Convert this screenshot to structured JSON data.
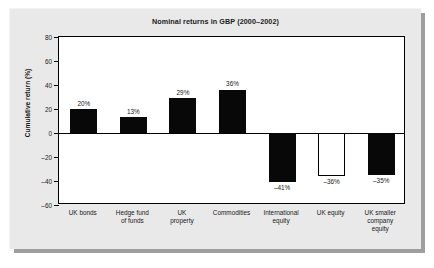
{
  "chart_data": {
    "type": "bar",
    "title": "Nominal returns in GBP (2000–2002)",
    "xlabel": "",
    "ylabel": "Cumulative return (%)",
    "ylim": [
      -60,
      80
    ],
    "ytick_step": 20,
    "yticks": [
      80,
      60,
      40,
      20,
      0,
      -20,
      -40,
      -60
    ],
    "ytick_labels": [
      "80",
      "60",
      "40",
      "20",
      "0",
      "–20",
      "–40",
      "–60"
    ],
    "grid": false,
    "legend": null,
    "categories": [
      "UK bonds",
      "Hedge fund of funds",
      "UK property",
      "Commodities",
      "International equity",
      "UK equity",
      "UK smaller company equity"
    ],
    "category_lines": [
      [
        "UK bonds"
      ],
      [
        "Hedge fund",
        "of funds"
      ],
      [
        "UK",
        "property"
      ],
      [
        "Commodities"
      ],
      [
        "International",
        "equity"
      ],
      [
        "UK equity"
      ],
      [
        "UK smaller",
        "company",
        "equity"
      ]
    ],
    "values": [
      20,
      13,
      29,
      36,
      -41,
      -36,
      -35
    ],
    "value_labels": [
      "20%",
      "13%",
      "29%",
      "36%",
      "–41%",
      "–36%",
      "–35%"
    ],
    "bar_styles": [
      "filled",
      "filled",
      "filled",
      "filled",
      "filled",
      "hollow",
      "filled"
    ],
    "colors": {
      "bar_filled": "#080808",
      "bar_hollow": "#ffffff",
      "bar_outline": "#000000",
      "plot_background": "#ffffff",
      "card_background": "#e9e9e9",
      "axis": "#000000",
      "text": "#1a1a1a"
    }
  }
}
